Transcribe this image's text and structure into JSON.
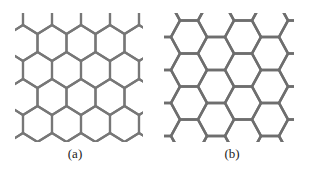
{
  "figure": {
    "panels": [
      {
        "label": "(a)",
        "orientation": "pointy-top",
        "line_color": "#777777",
        "line_width": 2.2,
        "side": 18,
        "col_spacing": 29,
        "row_spacing": 27,
        "origin_x": 23,
        "origin_y": 43,
        "clip": [
          15,
          13,
          143,
          142
        ]
      },
      {
        "label": "(b)",
        "orientation": "flat-top",
        "line_color": "#6e6e6e",
        "line_width": 2.6,
        "side": 17.5,
        "col_spacing": 27,
        "row_spacing": 33,
        "origin_x": 34,
        "origin_y": 37,
        "clip": [
          9,
          13,
          139,
          142
        ]
      }
    ]
  }
}
